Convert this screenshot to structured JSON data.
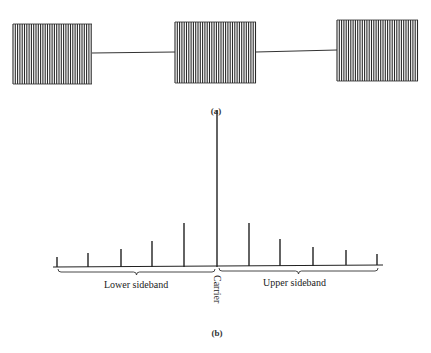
{
  "figure_a": {
    "caption": "(a)",
    "description": "Pulse-modulated carrier: three bursts of RF oscillation separated by flat baseline",
    "bursts": [
      {
        "x0": 13,
        "x1": 92,
        "top": 24,
        "bottom": 84
      },
      {
        "x0": 175,
        "x1": 256,
        "top": 22,
        "bottom": 83
      },
      {
        "x0": 337,
        "x1": 418,
        "top": 20,
        "bottom": 81
      }
    ],
    "baseline_y": [
      53,
      52,
      50
    ],
    "color": "#2a2a2a"
  },
  "figure_b": {
    "caption": "(b)",
    "carrier_label": "Carrier",
    "lower_label": "Lower sideband",
    "upper_label": "Upper sideband",
    "baseline": {
      "x0": 53,
      "y0": 267,
      "x1": 383,
      "y1": 265
    },
    "lines": [
      {
        "x": 57,
        "top": 257,
        "bottom": 267
      },
      {
        "x": 88,
        "top": 253,
        "bottom": 267
      },
      {
        "x": 121,
        "top": 249,
        "bottom": 267
      },
      {
        "x": 152,
        "top": 241,
        "bottom": 267
      },
      {
        "x": 184,
        "top": 223,
        "bottom": 267
      },
      {
        "x": 217,
        "top": 110,
        "bottom": 267
      },
      {
        "x": 249,
        "top": 223,
        "bottom": 266
      },
      {
        "x": 280,
        "top": 239,
        "bottom": 266
      },
      {
        "x": 313,
        "top": 247,
        "bottom": 266
      },
      {
        "x": 346,
        "top": 250,
        "bottom": 265
      },
      {
        "x": 377,
        "top": 254,
        "bottom": 265
      }
    ]
  }
}
